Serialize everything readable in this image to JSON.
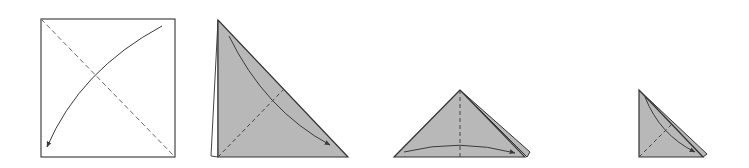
{
  "diagram": {
    "type": "origami-folding-steps",
    "colors": {
      "paper_front": "#ffffff",
      "paper_back": "#b8b8b8",
      "line": "#333333",
      "dashed": "#555555",
      "arrow": "#3a3a3a"
    },
    "steps": [
      {
        "id": 1,
        "description": "Square sheet, valley-fold diagonal, arrow folding top-right corner to bottom-left"
      },
      {
        "id": 2,
        "description": "Folded triangle, dashed diagonal, arrow folding top corner to bottom-right"
      },
      {
        "id": 3,
        "description": "Smaller triangle, vertical dashed center line, arrow folding left to right"
      },
      {
        "id": 4,
        "description": "Small right triangle with dashed diagonal and fold arrow"
      }
    ]
  }
}
